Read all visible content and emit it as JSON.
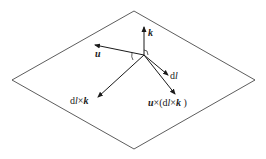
{
  "diagram": {
    "type": "vector-diagram",
    "plane": {
      "shape": "parallelogram",
      "points": [
        [
          134,
          11
        ],
        [
          255,
          80
        ],
        [
          134,
          149
        ],
        [
          12,
          80
        ]
      ]
    },
    "origin": [
      144,
      55
    ],
    "vectors": [
      {
        "id": "k",
        "label": "k",
        "to": [
          144,
          27
        ]
      },
      {
        "id": "u",
        "label": "u",
        "to": [
          95,
          45
        ]
      },
      {
        "id": "dl",
        "label": "dl",
        "to": [
          168,
          75
        ]
      },
      {
        "id": "dlxk",
        "label": "dl×k",
        "to": [
          98,
          97
        ]
      },
      {
        "id": "uxdlxk",
        "label": "u×(dl×k)",
        "to": [
          175,
          94
        ]
      }
    ],
    "labels": {
      "k": "k",
      "u": "u",
      "dl_d": "d",
      "dl_l": "l",
      "dlxk_d": "d",
      "dlxk_l": "l",
      "dlxk_times": "×",
      "dlxk_k": "k",
      "u2": "u",
      "times1": "×(",
      "d2": "d",
      "l2": "l",
      "times2": "×",
      "k2": "k",
      "close": " )"
    },
    "colors": {
      "line": "#1a1a1a",
      "background": "#ffffff"
    }
  }
}
